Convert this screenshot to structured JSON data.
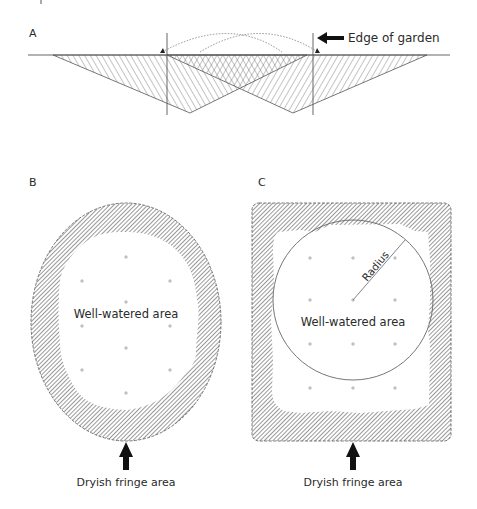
{
  "panels": {
    "a": {
      "label": "A",
      "edge_label": "Edge of garden"
    },
    "b": {
      "label": "B",
      "inner_label": "Well-watered area",
      "fringe_label": "Dryish fringe area"
    },
    "c": {
      "label": "C",
      "inner_label": "Well-watered area",
      "radius_label": "Radius",
      "fringe_label": "Dryish fringe area"
    }
  },
  "colors": {
    "line": "#555555",
    "hatch": "#444444",
    "text": "#2a2a2a",
    "arrow": "#111111",
    "background": "#ffffff"
  }
}
